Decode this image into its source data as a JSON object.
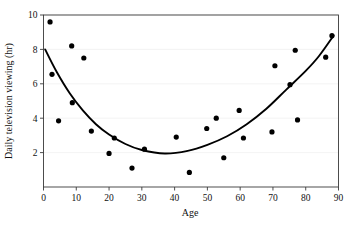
{
  "chart_data": {
    "type": "scatter",
    "title": "",
    "xlabel": "Age",
    "ylabel": "Daily television viewing (hr)",
    "xlim": [
      0,
      90
    ],
    "ylim": [
      0,
      10
    ],
    "grid": true,
    "legend_position": "none",
    "xticks": [
      0,
      10,
      20,
      30,
      40,
      50,
      60,
      70,
      80,
      90
    ],
    "yticks": [
      2,
      4,
      6,
      8,
      10
    ],
    "xtick_labels": [
      "0",
      "10",
      "20",
      "30",
      "40",
      "50",
      "60",
      "70",
      "80",
      "90"
    ],
    "ytick_labels": [
      "2",
      "4",
      "6",
      "8",
      "10"
    ],
    "points": [
      {
        "x": 2.0,
        "y": 9.6
      },
      {
        "x": 2.6,
        "y": 6.55
      },
      {
        "x": 4.6,
        "y": 3.85
      },
      {
        "x": 8.6,
        "y": 8.2
      },
      {
        "x": 8.8,
        "y": 4.9
      },
      {
        "x": 12.3,
        "y": 7.5
      },
      {
        "x": 14.6,
        "y": 3.25
      },
      {
        "x": 20.0,
        "y": 1.95
      },
      {
        "x": 21.6,
        "y": 2.85
      },
      {
        "x": 27.0,
        "y": 1.1
      },
      {
        "x": 30.8,
        "y": 2.2
      },
      {
        "x": 40.5,
        "y": 2.9
      },
      {
        "x": 44.5,
        "y": 0.85
      },
      {
        "x": 49.8,
        "y": 3.4
      },
      {
        "x": 52.7,
        "y": 4.0
      },
      {
        "x": 55.0,
        "y": 1.7
      },
      {
        "x": 59.7,
        "y": 4.45
      },
      {
        "x": 61.0,
        "y": 2.85
      },
      {
        "x": 69.7,
        "y": 3.2
      },
      {
        "x": 70.6,
        "y": 7.05
      },
      {
        "x": 75.2,
        "y": 5.95
      },
      {
        "x": 76.8,
        "y": 7.95
      },
      {
        "x": 77.5,
        "y": 3.9
      },
      {
        "x": 86.1,
        "y": 7.55
      },
      {
        "x": 88.0,
        "y": 8.8
      }
    ],
    "fit_curve": {
      "kind": "quadratic",
      "description": "U-shaped least-squares quadratic fit of daily television viewing on age",
      "vertex": {
        "x": 37.0,
        "y": 1.95
      },
      "endpoints": [
        {
          "x": 0.5,
          "y": 8.0
        },
        {
          "x": 88.5,
          "y": 8.8
        }
      ],
      "samples": [
        {
          "x": 0.5,
          "y": 8.0
        },
        {
          "x": 4.0,
          "y": 6.7
        },
        {
          "x": 8.0,
          "y": 5.45
        },
        {
          "x": 12.0,
          "y": 4.45
        },
        {
          "x": 16.0,
          "y": 3.65
        },
        {
          "x": 20.0,
          "y": 3.05
        },
        {
          "x": 25.0,
          "y": 2.5
        },
        {
          "x": 30.0,
          "y": 2.15
        },
        {
          "x": 37.0,
          "y": 1.95
        },
        {
          "x": 44.0,
          "y": 2.1
        },
        {
          "x": 50.0,
          "y": 2.45
        },
        {
          "x": 56.0,
          "y": 2.95
        },
        {
          "x": 62.0,
          "y": 3.65
        },
        {
          "x": 68.0,
          "y": 4.55
        },
        {
          "x": 74.0,
          "y": 5.65
        },
        {
          "x": 80.0,
          "y": 6.75
        },
        {
          "x": 84.0,
          "y": 7.6
        },
        {
          "x": 88.5,
          "y": 8.8
        }
      ]
    },
    "marker": {
      "shape": "circle",
      "radius": 2.6,
      "color": "#000000"
    },
    "curve_color": "#000000",
    "grid_color": "#f0f0f0",
    "axis_color": "#3a3a3a"
  },
  "caption": {
    "partial_text": ""
  }
}
